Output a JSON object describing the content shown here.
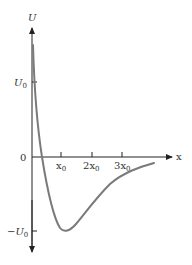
{
  "diagram": {
    "type": "potential-energy-curve",
    "y_axis_label": "U",
    "x_axis_label": "x",
    "origin_label": "0",
    "y_ticks": [
      {
        "main": "U",
        "sub": "0",
        "prefix": "",
        "value": 1
      },
      {
        "main": "U",
        "sub": "0",
        "prefix": "−",
        "value": -1
      }
    ],
    "x_ticks": [
      {
        "coef": "",
        "main": "x",
        "sub": "0",
        "value": 1
      },
      {
        "coef": "2",
        "main": "x",
        "sub": "0",
        "value": 2
      },
      {
        "coef": "3",
        "main": "x",
        "sub": "0",
        "value": 3
      }
    ],
    "curve_description": "Potential well: steep repulsive wall near origin, minimum of -U0 at x = x0, rising asymptotically toward 0 for large x",
    "curve_color": "#7a7a7a",
    "axis_color": "#222222"
  }
}
